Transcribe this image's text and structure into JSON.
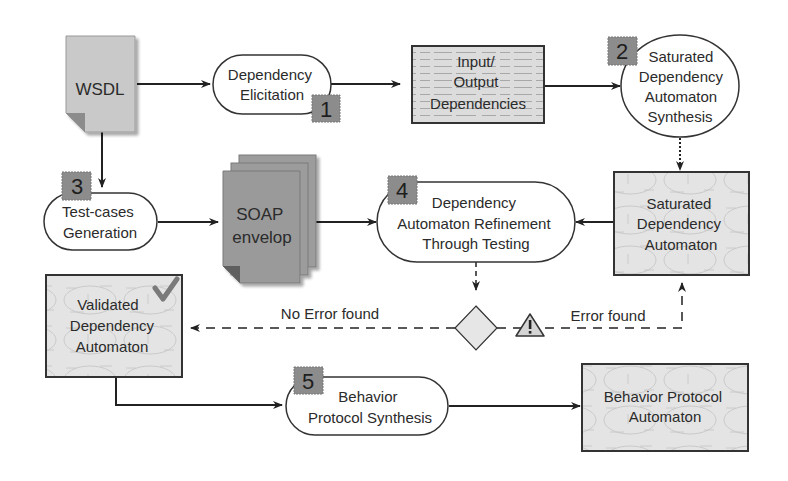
{
  "diagram": {
    "nodes": {
      "wsdl": {
        "label": "WSDL"
      },
      "dep_elicitation": {
        "lines": [
          "Dependency",
          "Elicitation"
        ],
        "step": "1"
      },
      "io_deps": {
        "lines": [
          "Input/",
          "Output",
          "Dependencies"
        ]
      },
      "sat_synthesis": {
        "lines": [
          "Saturated",
          "Dependency",
          "Automaton",
          "Synthesis"
        ],
        "step": "2"
      },
      "testcases": {
        "lines": [
          "Test-cases",
          "Generation"
        ],
        "step": "3"
      },
      "soap": {
        "lines": [
          "SOAP",
          "envelop"
        ]
      },
      "refinement": {
        "lines": [
          "Dependency",
          "Automaton Refinement",
          "Through Testing"
        ],
        "step": "4"
      },
      "sat_automaton": {
        "lines": [
          "Saturated",
          "Dependency",
          "Automaton"
        ]
      },
      "validated": {
        "lines": [
          "Validated",
          "Dependency",
          "Automaton"
        ],
        "icon": "checkmark-icon"
      },
      "behavior_synthesis": {
        "lines": [
          "Behavior",
          "Protocol Synthesis"
        ],
        "step": "5"
      },
      "behavior_automaton": {
        "lines": [
          "Behavior Protocol",
          "Automaton"
        ]
      }
    },
    "edges": {
      "no_error": "No Error found",
      "error": "Error found"
    },
    "colors": {
      "badge": "#8c8c8c",
      "document": "#c8c8c8",
      "soap": "#9a9a9a",
      "box_fill": "#e6e6e6",
      "stroke": "#333333"
    }
  }
}
